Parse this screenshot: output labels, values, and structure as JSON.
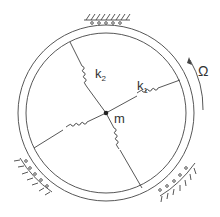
{
  "figure": {
    "labels": {
      "spring1": "k",
      "spring1_sub": "1",
      "spring2": "k",
      "spring2_sub": "2",
      "mass": "m",
      "angular_velocity": "Ω"
    },
    "colors": {
      "line": "#444444",
      "background": "#ffffff"
    }
  }
}
